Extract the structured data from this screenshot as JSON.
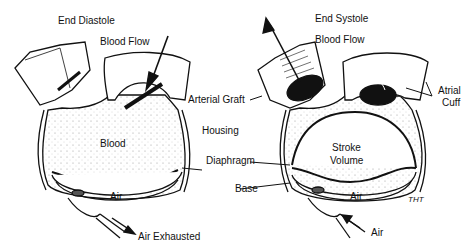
{
  "diagram": {
    "left_panel": {
      "title": "End Diastole",
      "labels": {
        "blood_flow": "Blood Flow",
        "blood": "Blood",
        "air": "Air",
        "air_exhausted": "Air Exhausted"
      }
    },
    "right_panel": {
      "title": "End Systole",
      "labels": {
        "blood_flow": "Blood Flow",
        "stroke_volume_1": "Stroke",
        "stroke_volume_2": "Volume",
        "air": "Air",
        "air_in": "Air",
        "atrial_cuff_1": "Atrial",
        "atrial_cuff_2": "Cuff"
      }
    },
    "shared_labels": {
      "arterial_graft": "Arterial Graft",
      "housing": "Housing",
      "diaphragm": "Diaphragm",
      "base": "Base"
    },
    "signature": "THT"
  }
}
